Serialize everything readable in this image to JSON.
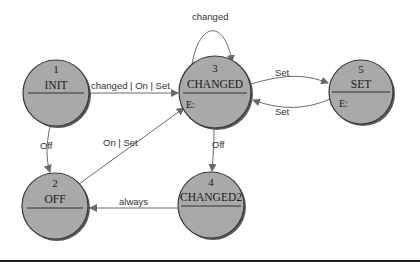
{
  "diagram": {
    "title": "",
    "states": [
      {
        "id": "1",
        "number": "1",
        "name": "INIT",
        "entry": ""
      },
      {
        "id": "2",
        "number": "2",
        "name": "OFF",
        "entry": ""
      },
      {
        "id": "3",
        "number": "3",
        "name": "CHANGED",
        "entry": "E:"
      },
      {
        "id": "4",
        "number": "4",
        "name": "CHANGED2",
        "entry": ""
      },
      {
        "id": "5",
        "number": "5",
        "name": "SET",
        "entry": "E:"
      }
    ],
    "transitions": [
      {
        "from": "1",
        "to": "3",
        "label": "changed | On | Set"
      },
      {
        "from": "3",
        "to": "3",
        "label": "changed"
      },
      {
        "from": "3",
        "to": "5",
        "label": "Set"
      },
      {
        "from": "5",
        "to": "3",
        "label": "Set"
      },
      {
        "from": "1",
        "to": "2",
        "label": "Off"
      },
      {
        "from": "2",
        "to": "3",
        "label": "On | Set"
      },
      {
        "from": "3",
        "to": "4",
        "label": "Off"
      },
      {
        "from": "4",
        "to": "2",
        "label": "always"
      }
    ],
    "colors": {
      "node_fill": "#a9a9a9",
      "node_stroke": "#3a3a3a",
      "edge": "#6a6a6a"
    }
  }
}
